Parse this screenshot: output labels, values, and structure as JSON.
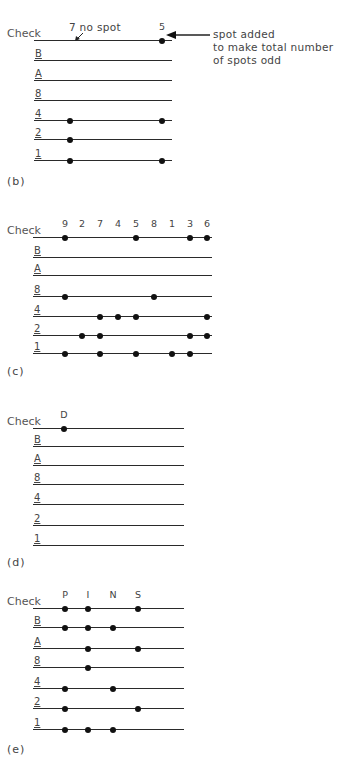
{
  "figure": {
    "row_labels": [
      "Check",
      "B",
      "A",
      "8",
      "4",
      "2",
      "1"
    ],
    "panels": [
      {
        "id": "b",
        "caption": "(b)",
        "columns": [
          {
            "label": "",
            "x": 70
          },
          {
            "label": "5",
            "x": 162
          }
        ],
        "line_x": [
          34,
          172
        ],
        "row_y": [
          40,
          60,
          80,
          100,
          120,
          139,
          160
        ],
        "caption_y": 182,
        "spots": {
          "Check": [
            1
          ],
          "B": [],
          "A": [],
          "8": [],
          "4": [
            0,
            1
          ],
          "2": [
            0
          ],
          "1": [
            0,
            1
          ]
        },
        "annotations": {
          "no_spot_label": "7 no spot",
          "added_spot_note": [
            "spot added",
            "to make total number",
            "of spots odd"
          ]
        }
      },
      {
        "id": "c",
        "caption": "(c)",
        "columns": [
          {
            "label": "9",
            "x": 65
          },
          {
            "label": "2",
            "x": 82
          },
          {
            "label": "7",
            "x": 100
          },
          {
            "label": "4",
            "x": 118
          },
          {
            "label": "5",
            "x": 136
          },
          {
            "label": "8",
            "x": 154
          },
          {
            "label": "1",
            "x": 172
          },
          {
            "label": "3",
            "x": 190
          },
          {
            "label": "6",
            "x": 207
          }
        ],
        "line_x": [
          33,
          212
        ],
        "row_y": [
          237,
          257,
          275,
          296,
          316,
          335,
          353
        ],
        "caption_y": 372,
        "spots": {
          "Check": [
            0,
            4,
            7,
            8
          ],
          "B": [],
          "A": [],
          "8": [
            0,
            5
          ],
          "4": [
            2,
            3,
            4,
            8
          ],
          "2": [
            1,
            2,
            7,
            8
          ],
          "1": [
            0,
            2,
            4,
            6,
            7
          ]
        }
      },
      {
        "id": "d",
        "caption": "(d)",
        "columns": [
          {
            "label": "D",
            "x": 64
          }
        ],
        "line_x": [
          33,
          184
        ],
        "row_y": [
          428,
          446,
          465,
          484,
          504,
          525,
          545
        ],
        "caption_y": 563,
        "spots": {
          "Check": [
            0
          ],
          "B": [],
          "A": [],
          "8": [],
          "4": [],
          "2": [],
          "1": []
        }
      },
      {
        "id": "e",
        "caption": "(e)",
        "columns": [
          {
            "label": "P",
            "x": 65
          },
          {
            "label": "I",
            "x": 88
          },
          {
            "label": "N",
            "x": 113
          },
          {
            "label": "S",
            "x": 138
          }
        ],
        "line_x": [
          33,
          184
        ],
        "row_y": [
          608,
          627,
          648,
          667,
          688,
          708,
          729
        ],
        "caption_y": 750,
        "spots": {
          "Check": [
            0,
            1,
            3
          ],
          "B": [
            0,
            1,
            2
          ],
          "A": [
            1,
            3
          ],
          "8": [
            1
          ],
          "4": [
            0,
            2
          ],
          "2": [
            0,
            3
          ],
          "1": [
            0,
            1,
            2
          ]
        }
      }
    ]
  },
  "colors": {
    "line": "#2a2a2a",
    "spot": "#111111",
    "text": "#444444",
    "background": "#ffffff"
  }
}
